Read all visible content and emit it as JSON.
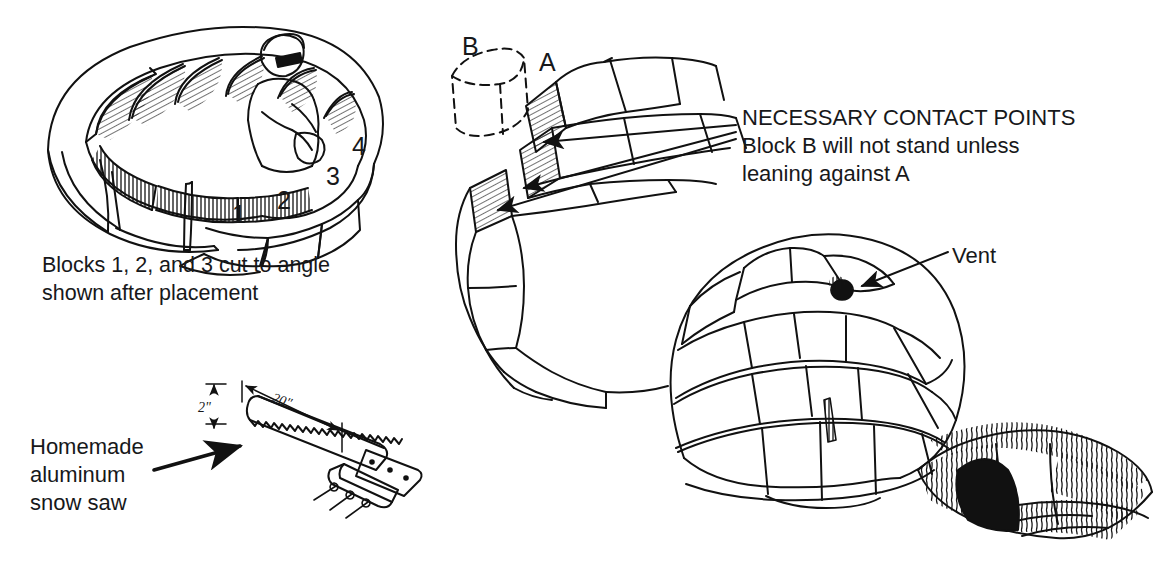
{
  "figure": {
    "background_color": "#ffffff",
    "ink_color": "#111111"
  },
  "panels": {
    "block_ring": {
      "name": "First course of snow blocks with builder inside",
      "caption_line1": "Blocks 1, 2, and 3 cut to angle",
      "caption_line2": "shown after placement",
      "block_numbers": [
        "1",
        "2",
        "3",
        "4"
      ]
    },
    "contact_points": {
      "name": "Spiral wall showing necessary contact points",
      "label_b": "B",
      "label_a": "A",
      "note_line1": "NECESSARY CONTACT POINTS",
      "note_line2": "Block B will not stand unless",
      "note_line3": "leaning against A",
      "arrow_count": 3
    },
    "snow_saw": {
      "name": "Homemade aluminum snow saw",
      "label_line1": "Homemade",
      "label_line2": "aluminum",
      "label_line3": "snow saw",
      "dimension_height": "2\"",
      "dimension_length": "20\""
    },
    "finished_igloo": {
      "name": "Completed igloo with vent and entrance trench",
      "vent_label": "Vent"
    }
  }
}
